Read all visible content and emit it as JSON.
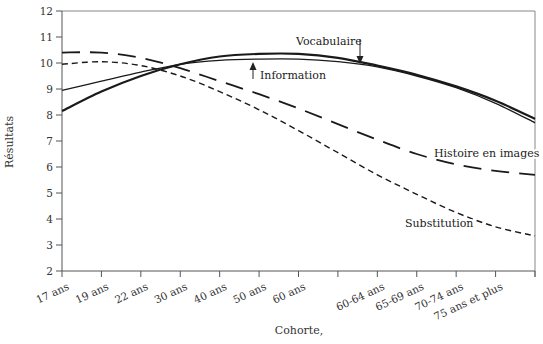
{
  "chart_data": {
    "type": "line",
    "title": "",
    "xlabel": "Cohorte,",
    "ylabel": "Résultats",
    "ylim": [
      2,
      12
    ],
    "yticks": [
      2,
      3,
      4,
      5,
      6,
      7,
      8,
      9,
      10,
      11,
      12
    ],
    "grid": false,
    "legend": "inline annotations",
    "categories": [
      "17 ans",
      "19 ans",
      "22 ans",
      "30 ans",
      "40 ans",
      "50 ans",
      "60 ans",
      "",
      "60-64 ans",
      "65-69 ans",
      "70-74 ans",
      "75 ans et plus",
      ""
    ],
    "series": [
      {
        "name": "Vocabulaire",
        "style": "solid-thick",
        "values": [
          8.15,
          8.9,
          9.5,
          9.95,
          10.25,
          10.35,
          10.35,
          10.2,
          9.9,
          9.55,
          9.1,
          8.55,
          7.85
        ]
      },
      {
        "name": "Information",
        "style": "solid-thin",
        "values": [
          8.95,
          9.3,
          9.65,
          9.95,
          10.1,
          10.15,
          10.15,
          10.05,
          9.85,
          9.5,
          9.05,
          8.45,
          7.7
        ]
      },
      {
        "name": "Histoire en images",
        "style": "long-dash",
        "values": [
          10.4,
          10.4,
          10.2,
          9.8,
          9.3,
          8.8,
          8.25,
          7.65,
          7.05,
          6.5,
          6.1,
          5.85,
          5.7
        ]
      },
      {
        "name": "Substitution",
        "style": "short-dash",
        "values": [
          9.95,
          10.05,
          9.9,
          9.5,
          8.9,
          8.2,
          7.4,
          6.55,
          5.7,
          4.95,
          4.25,
          3.7,
          3.35
        ]
      }
    ],
    "annotations": [
      {
        "text": "Vocabulaire",
        "arrow": "down"
      },
      {
        "text": "Information",
        "arrow": "up"
      },
      {
        "text": "Histoire en images"
      },
      {
        "text": "Substitution"
      }
    ]
  },
  "labels": {
    "ylabel": "Résultats",
    "xlabel": "Cohorte,",
    "vocabulaire": "Vocabulaire",
    "information": "Information",
    "histoire": "Histoire en images",
    "substitution": "Substitution"
  }
}
